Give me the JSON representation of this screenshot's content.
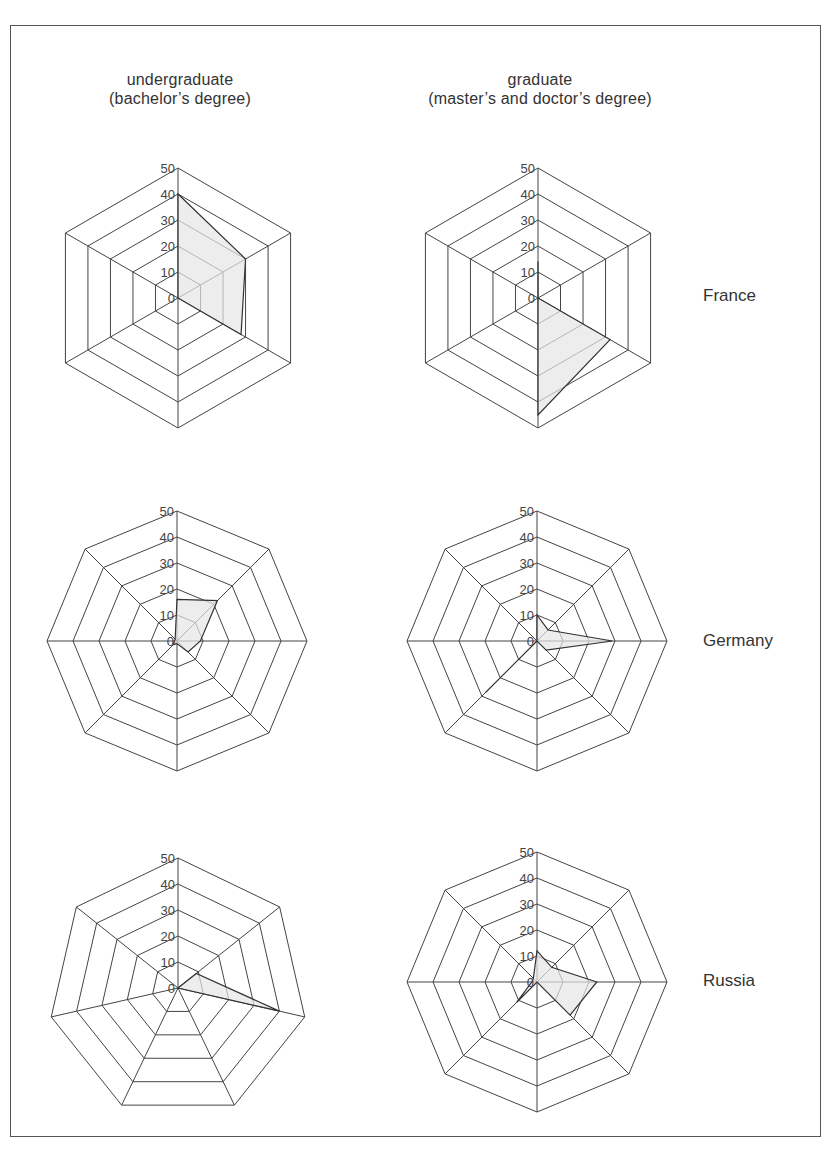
{
  "columns": [
    {
      "title": "undergraduate",
      "subtitle": "(bachelor’s degree)"
    },
    {
      "title": "graduate",
      "subtitle": "(master’s and doctor’s degree)"
    }
  ],
  "rows": [
    "France",
    "Germany",
    "Russia"
  ],
  "axis_ticks": [
    "0",
    "10",
    "20",
    "30",
    "40",
    "50"
  ],
  "chart_data": [
    {
      "type": "radar",
      "title": "France - undergraduate (bachelor's degree)",
      "axes": 6,
      "categories": [
        "",
        "",
        "",
        "",
        "",
        ""
      ],
      "values": [
        40,
        30,
        28,
        0,
        0,
        0
      ],
      "ylim": [
        0,
        50
      ],
      "grid": true
    },
    {
      "type": "radar",
      "title": "France - graduate (master's and doctor's degree)",
      "axes": 6,
      "categories": [
        "",
        "",
        "",
        "",
        "",
        ""
      ],
      "values": [
        14,
        0,
        32,
        45,
        0,
        0
      ],
      "ylim": [
        0,
        50
      ],
      "grid": true
    },
    {
      "type": "radar",
      "title": "Germany - undergraduate (bachelor's degree)",
      "axes": 8,
      "categories": [
        "",
        "",
        "",
        "",
        "",
        "",
        "",
        ""
      ],
      "values": [
        16,
        22,
        9,
        6,
        1,
        2,
        1,
        1
      ],
      "ylim": [
        0,
        50
      ],
      "grid": true
    },
    {
      "type": "radar",
      "title": "Germany - graduate (master's and doctor's degree)",
      "axes": 8,
      "categories": [
        "",
        "",
        "",
        "",
        "",
        "",
        "",
        ""
      ],
      "values": [
        10,
        6,
        29,
        5,
        0,
        28,
        0,
        0
      ],
      "ylim": [
        0,
        50
      ],
      "grid": true
    },
    {
      "type": "radar",
      "title": "Russia - undergraduate (bachelor's degree)",
      "axes": 7,
      "categories": [
        "",
        "",
        "",
        "",
        "",
        "",
        ""
      ],
      "values": [
        0,
        9,
        40,
        0,
        0,
        0,
        0
      ],
      "ylim": [
        0,
        50
      ],
      "grid": true
    },
    {
      "type": "radar",
      "title": "Russia - graduate (master's and doctor's degree)",
      "axes": 8,
      "categories": [
        "",
        "",
        "",
        "",
        "",
        "",
        "",
        ""
      ],
      "values": [
        12,
        8,
        23,
        18,
        0,
        11,
        2,
        2
      ],
      "ylim": [
        0,
        50
      ],
      "grid": true
    }
  ]
}
